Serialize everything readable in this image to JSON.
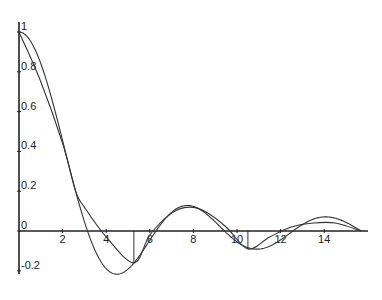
{
  "chart_data": {
    "type": "line",
    "title": "",
    "xlabel": "",
    "ylabel": "",
    "xlim": [
      0,
      15.7
    ],
    "ylim": [
      -0.28,
      1.0
    ],
    "grid": false,
    "legend": null,
    "x_ticks": [
      2,
      4,
      6,
      8,
      10,
      12,
      14
    ],
    "x_tick_labels": [
      "2",
      "4",
      "6",
      "8",
      "10",
      "12",
      "14"
    ],
    "y_ticks": [
      1,
      0.8,
      0.6,
      0.4,
      0.2,
      0,
      -0.2
    ],
    "y_tick_labels": [
      "1",
      "0.8",
      "0.6",
      "0.4",
      "0.2",
      "0",
      "-0.2"
    ],
    "series": [
      {
        "name": "sin(x)/x",
        "x": [
          0,
          0.5,
          1,
          1.5,
          2,
          2.5,
          3,
          3.5,
          4,
          4.5,
          5,
          5.5,
          6,
          6.5,
          7,
          7.5,
          8,
          8.5,
          9,
          9.5,
          10,
          10.5,
          11,
          11.5,
          12,
          12.5,
          13,
          13.5,
          14,
          14.5,
          15,
          15.5,
          15.7
        ],
        "values": [
          1,
          0.959,
          0.841,
          0.665,
          0.455,
          0.239,
          0.047,
          -0.1,
          -0.189,
          -0.217,
          -0.192,
          -0.128,
          -0.047,
          0.033,
          0.094,
          0.125,
          0.124,
          0.094,
          0.046,
          -0.008,
          -0.054,
          -0.084,
          -0.091,
          -0.077,
          -0.045,
          -0.005,
          0.032,
          0.058,
          0.071,
          0.065,
          0.043,
          0.011,
          0
        ]
      },
      {
        "name": "approximation",
        "x": [
          0,
          1,
          2,
          2.6,
          3,
          4,
          5.27,
          6,
          7,
          7.8,
          8.5,
          9.5,
          10.5,
          11.5,
          12.5,
          13.5,
          14.5,
          15.7
        ],
        "values": [
          1,
          0.75,
          0.44,
          0.2,
          0.12,
          -0.03,
          -0.16,
          -0.02,
          0.09,
          0.12,
          0.1,
          0.02,
          -0.09,
          -0.03,
          0.02,
          0.04,
          0.04,
          0
        ]
      }
    ],
    "annotations": [
      {
        "type": "vline",
        "x": 5.27,
        "from": 0,
        "to": -0.16
      },
      {
        "type": "vline",
        "x": 10.5,
        "from": 0,
        "to": -0.09
      }
    ]
  }
}
